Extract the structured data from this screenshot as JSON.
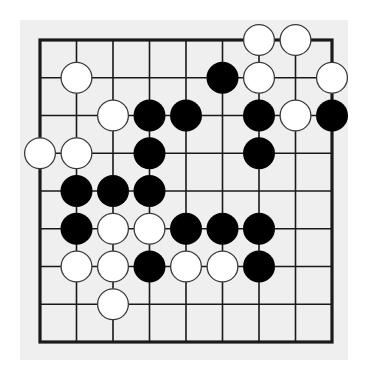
{
  "board": {
    "size": {
      "cols": 9,
      "rows": 9
    },
    "colors": {
      "page_background": "#ffffff",
      "board_background": "#efefef",
      "grid_line": "#1a1a1a",
      "black_stone": "#000000",
      "white_stone": "#ffffff",
      "white_stone_outline": "#3a3a3a"
    },
    "stones": [
      {
        "color": "white",
        "col": 6,
        "row": 0
      },
      {
        "color": "white",
        "col": 7,
        "row": 0
      },
      {
        "color": "white",
        "col": 1,
        "row": 1
      },
      {
        "color": "black",
        "col": 5,
        "row": 1
      },
      {
        "color": "white",
        "col": 6,
        "row": 1
      },
      {
        "color": "white",
        "col": 8,
        "row": 1
      },
      {
        "color": "white",
        "col": 2,
        "row": 2
      },
      {
        "color": "black",
        "col": 3,
        "row": 2
      },
      {
        "color": "black",
        "col": 4,
        "row": 2
      },
      {
        "color": "black",
        "col": 6,
        "row": 2
      },
      {
        "color": "white",
        "col": 7,
        "row": 2
      },
      {
        "color": "black",
        "col": 8,
        "row": 2
      },
      {
        "color": "white",
        "col": 0,
        "row": 3
      },
      {
        "color": "white",
        "col": 1,
        "row": 3
      },
      {
        "color": "black",
        "col": 3,
        "row": 3
      },
      {
        "color": "black",
        "col": 6,
        "row": 3
      },
      {
        "color": "black",
        "col": 1,
        "row": 4
      },
      {
        "color": "black",
        "col": 2,
        "row": 4
      },
      {
        "color": "black",
        "col": 3,
        "row": 4
      },
      {
        "color": "black",
        "col": 1,
        "row": 5
      },
      {
        "color": "white",
        "col": 2,
        "row": 5
      },
      {
        "color": "white",
        "col": 3,
        "row": 5
      },
      {
        "color": "black",
        "col": 4,
        "row": 5
      },
      {
        "color": "black",
        "col": 5,
        "row": 5
      },
      {
        "color": "black",
        "col": 6,
        "row": 5
      },
      {
        "color": "white",
        "col": 1,
        "row": 6
      },
      {
        "color": "white",
        "col": 2,
        "row": 6
      },
      {
        "color": "black",
        "col": 3,
        "row": 6
      },
      {
        "color": "white",
        "col": 4,
        "row": 6
      },
      {
        "color": "white",
        "col": 5,
        "row": 6
      },
      {
        "color": "black",
        "col": 6,
        "row": 6
      },
      {
        "color": "white",
        "col": 2,
        "row": 7
      }
    ]
  }
}
